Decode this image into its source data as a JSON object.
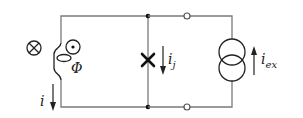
{
  "diagram": {
    "labels": {
      "loop_current": "i",
      "flux": "Φ",
      "junction_current": "i",
      "junction_current_sub": "j",
      "external_current": "i",
      "external_current_sub": "ex"
    },
    "symbols": {
      "field_into_page": "cross-circle-icon",
      "field_out_of_page": "dot-circle-icon",
      "inductor": "inductor-coil",
      "josephson_junction": "x-junction",
      "current_source": "double-circle-current-source",
      "terminals": "open-circle-terminal"
    },
    "colors": {
      "wire": "#7a7a7a",
      "symbol": "#222222",
      "background": "#ffffff"
    }
  }
}
